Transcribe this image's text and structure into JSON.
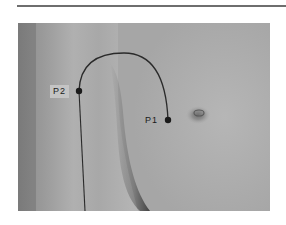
{
  "figure": {
    "points": [
      {
        "id": "P1",
        "label": "P1",
        "x": 168,
        "y": 120
      },
      {
        "id": "P2",
        "label": "P2",
        "x": 79,
        "y": 91
      }
    ],
    "path": {
      "from": "P2",
      "arc_apex": {
        "x": 124,
        "y": 53
      },
      "to": "P1",
      "descending_line_end": {
        "x": 85,
        "y": 211
      }
    },
    "colors": {
      "line": "#2a2a2a",
      "marker": "#1a1a1a",
      "skin_light": "#b4b4b4",
      "skin_dark": "#8c8c8c",
      "rule": "#6e6e6e"
    }
  }
}
